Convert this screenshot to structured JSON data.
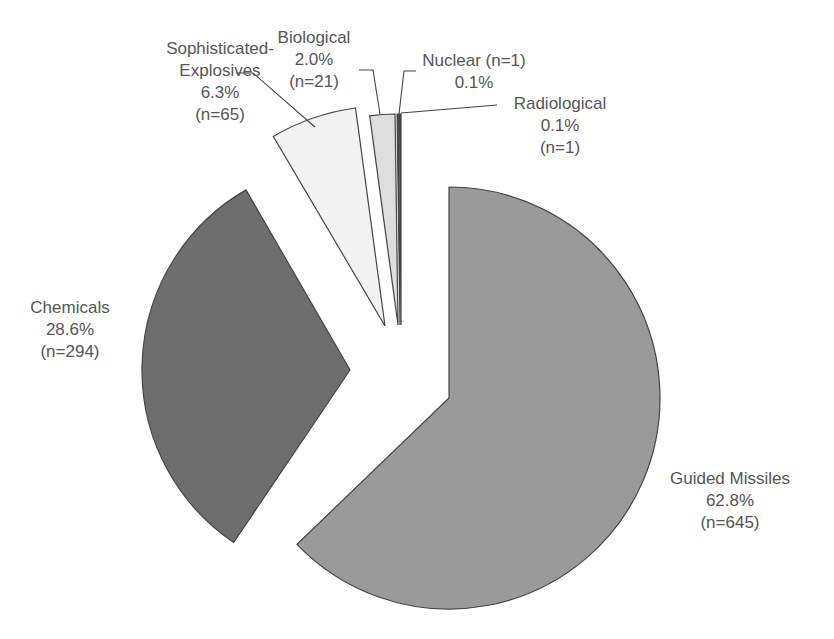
{
  "chart_data": {
    "type": "pie",
    "title": "",
    "exploded": true,
    "categories": [
      "Guided Missiles",
      "Chemicals",
      "Sophisticated-Explosives",
      "Biological",
      "Nuclear",
      "Radiological"
    ],
    "values": [
      62.8,
      28.6,
      6.3,
      2.0,
      0.1,
      0.1
    ],
    "counts": [
      645,
      294,
      65,
      21,
      1,
      1
    ],
    "unit": "%",
    "legend": "none (direct labels)",
    "slices": [
      {
        "key": "guided",
        "name": "Guided Missiles",
        "pct_label": "62.8%",
        "n_label": "(n=645)",
        "percent": 62.8,
        "n": 645,
        "color": "#9a9a9a",
        "cx": 449,
        "cy": 398,
        "r": 211,
        "start": 0,
        "end": 226.1
      },
      {
        "key": "chemicals",
        "name": "Chemicals",
        "pct_label": "28.6%",
        "n_label": "(n=294)",
        "percent": 28.6,
        "n": 294,
        "color": "#6e6e6e",
        "cx": 350,
        "cy": 370,
        "r": 208,
        "start": 214,
        "end": 330
      },
      {
        "key": "sophexp",
        "name": "Sophisticated-Explosives",
        "pct_label": "6.3%",
        "n_label": "(n=65)",
        "percent": 6.3,
        "n": 65,
        "color": "#f2f2f2",
        "cx": 385,
        "cy": 326,
        "r": 220,
        "start": 329.5,
        "end": 352.3
      },
      {
        "key": "biological",
        "name": "Biological",
        "pct_label": "2.0%",
        "n_label": "(n=21)",
        "percent": 2.0,
        "n": 21,
        "color": "#dddddd",
        "cx": 398,
        "cy": 325,
        "r": 211,
        "start": 352.3,
        "end": 359.2
      },
      {
        "key": "nuclear",
        "name": "Nuclear",
        "pct_label": "0.1%",
        "n_label": "(n=1)",
        "percent": 0.1,
        "n": 1,
        "color": "#555555",
        "cx": 400,
        "cy": 325,
        "r": 211,
        "start": 359.2,
        "end": 359.6
      },
      {
        "key": "radiological",
        "name": "Radiological",
        "pct_label": "0.1%",
        "n_label": "(n=1)",
        "percent": 0.1,
        "n": 1,
        "color": "#3d3d3d",
        "cx": 401,
        "cy": 325,
        "r": 211,
        "start": 359.6,
        "end": 360.0
      }
    ],
    "leaders": [
      {
        "for": "sophexp",
        "points": [
          [
            236,
            73
          ],
          [
            253,
            73
          ],
          [
            315,
            127
          ]
        ]
      },
      {
        "for": "biological",
        "points": [
          [
            359,
            70
          ],
          [
            373,
            70
          ],
          [
            380,
            114
          ]
        ]
      },
      {
        "for": "nuclear",
        "points": [
          [
            416,
            71
          ],
          [
            404,
            71
          ],
          [
            399,
            114
          ]
        ]
      },
      {
        "for": "radiological",
        "points": [
          [
            401,
            113
          ],
          [
            497,
            105
          ]
        ]
      }
    ]
  },
  "labels": {
    "sophexp": {
      "line1": "Sophisticated-",
      "line2": "Explosives",
      "pct": "6.3%",
      "n": "(n=65)"
    },
    "biological": {
      "line1": "Biological",
      "pct": "2.0%",
      "n": "(n=21)"
    },
    "nuclear": {
      "line1": "Nuclear (n=1)",
      "pct": "0.1%"
    },
    "radiological": {
      "line1": "Radiological",
      "pct": "0.1%",
      "n": "(n=1)"
    },
    "chemicals": {
      "line1": "Chemicals",
      "pct": "28.6%",
      "n": "(n=294)"
    },
    "guided": {
      "line1": "Guided Missiles",
      "pct": "62.8%",
      "n": "(n=645)"
    }
  }
}
